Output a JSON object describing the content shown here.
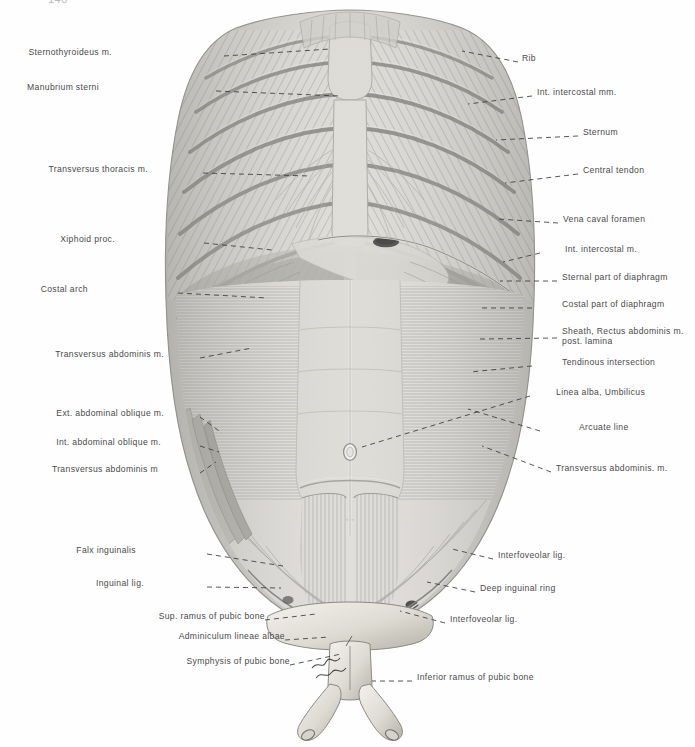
{
  "page": {
    "number": "140",
    "background": "#fefefe",
    "label_color": "#4a4a4a",
    "leader_color": "#3a3a3a"
  },
  "figure": {
    "type": "anatomical-engraving",
    "orientation": "posterior view of anterior body wall",
    "shading": "halftone engraving, grayscale"
  },
  "labels_left": [
    {
      "text": "Sternothyroideus m.",
      "x": 112,
      "y": 51,
      "lx": 224,
      "ly": 56,
      "tx": 330,
      "ty": 49
    },
    {
      "text": "Manubrium sterni",
      "x": 99,
      "y": 86,
      "lx": 216,
      "ly": 91,
      "tx": 340,
      "ty": 96
    },
    {
      "text": "Transversus thoracis m.",
      "x": 48,
      "y": 168,
      "lx": 203,
      "ly": 173,
      "tx": 310,
      "ty": 176
    },
    {
      "text": "Xiphoid proc.",
      "x": 115,
      "y": 238,
      "lx": 204,
      "ly": 243,
      "tx": 272,
      "ty": 250
    },
    {
      "text": "Costal arch",
      "x": 88,
      "y": 288,
      "lx": 178,
      "ly": 293,
      "tx": 268,
      "ty": 298
    },
    {
      "text": "Transversus abdominis m.",
      "x": 32,
      "y": 353,
      "lx": 200,
      "ly": 358,
      "tx": 252,
      "ty": 348
    },
    {
      "text": "Ext. abdominal oblique m.",
      "x": 32,
      "y": 412,
      "lx": 200,
      "ly": 417,
      "tx": 222,
      "ty": 433
    },
    {
      "text": "Int. abdominal oblique m.",
      "x": 35,
      "y": 441,
      "lx": 200,
      "ly": 446,
      "tx": 219,
      "ty": 452
    },
    {
      "text": "Transversus abdominis m",
      "x": 38,
      "y": 468,
      "lx": 200,
      "ly": 473,
      "tx": 216,
      "ty": 462
    },
    {
      "text": "Falx inguinalis",
      "x": 136,
      "y": 549,
      "lx": 207,
      "ly": 554,
      "tx": 283,
      "ty": 566
    },
    {
      "text": "Inguinal lig.",
      "x": 144,
      "y": 582,
      "lx": 207,
      "ly": 587,
      "tx": 281,
      "ty": 588
    },
    {
      "text": "Sup. ramus of pubic bone",
      "x": 135,
      "y": 615,
      "lx": 265,
      "ly": 620,
      "tx": 316,
      "ty": 614
    },
    {
      "text": "Adminiculum lineae albae",
      "x": 146,
      "y": 635,
      "lx": 285,
      "ly": 640,
      "tx": 330,
      "ty": 637
    },
    {
      "text": "Symphysis of pubic bone",
      "x": 163,
      "y": 660,
      "lx": 290,
      "ly": 665,
      "tx": 341,
      "ty": 654
    }
  ],
  "labels_right": [
    {
      "text": "Rib",
      "x": 522,
      "y": 57,
      "lx": 518,
      "ly": 62,
      "tx": 462,
      "ty": 51
    },
    {
      "text": "Int. intercostal mm.",
      "x": 537,
      "y": 91,
      "lx": 532,
      "ly": 96,
      "tx": 468,
      "ty": 104
    },
    {
      "text": "Sternum",
      "x": 583,
      "y": 131,
      "lx": 578,
      "ly": 136,
      "tx": 496,
      "ty": 140
    },
    {
      "text": "Central tendon",
      "x": 583,
      "y": 169,
      "lx": 578,
      "ly": 174,
      "tx": 505,
      "ty": 183
    },
    {
      "text": "Vena caval foramen",
      "x": 563,
      "y": 218,
      "lx": 558,
      "ly": 223,
      "tx": 498,
      "ty": 219
    },
    {
      "text": "Int. intercostal m.",
      "x": 565,
      "y": 248,
      "lx": 540,
      "ly": 253,
      "tx": 503,
      "ty": 262
    },
    {
      "text": "Sternal part of diaphragm",
      "x": 562,
      "y": 276,
      "lx": 557,
      "ly": 281,
      "tx": 500,
      "ty": 281
    },
    {
      "text": "Costal part of diaphragm",
      "x": 562,
      "y": 303,
      "lx": 532,
      "ly": 308,
      "tx": 478,
      "ty": 308
    },
    {
      "text": "Sheath, Rectus abdominis m.",
      "x": 562,
      "y": 330,
      "lx": 557,
      "ly": 338,
      "tx": 480,
      "ty": 339
    },
    {
      "text": "post. lamina",
      "x": 562,
      "y": 340,
      "lx": 0,
      "ly": 0,
      "tx": 0,
      "ty": 0
    },
    {
      "text": "Tendinous intersection",
      "x": 562,
      "y": 361,
      "lx": 532,
      "ly": 366,
      "tx": 470,
      "ty": 372
    },
    {
      "text": "Linea alba, Umbilicus",
      "x": 556,
      "y": 391,
      "lx": 530,
      "ly": 396,
      "tx": 352,
      "ty": 452
    },
    {
      "text": "Arcuate line",
      "x": 579,
      "y": 426,
      "lx": 540,
      "ly": 431,
      "tx": 468,
      "ty": 409
    },
    {
      "text": "Transversus abdominis. m.",
      "x": 556,
      "y": 467,
      "lx": 551,
      "ly": 472,
      "tx": 482,
      "ty": 446
    },
    {
      "text": "Interfoveolar lig.",
      "x": 498,
      "y": 554,
      "lx": 493,
      "ly": 559,
      "tx": 452,
      "ty": 549
    },
    {
      "text": "Deep inguinal ring",
      "x": 480,
      "y": 587,
      "lx": 475,
      "ly": 592,
      "tx": 427,
      "ty": 582
    },
    {
      "text": "Interfoveolar lig.",
      "x": 450,
      "y": 618,
      "lx": 445,
      "ly": 623,
      "tx": 400,
      "ty": 611
    },
    {
      "text": "Inferior ramus of pubic bone",
      "x": 417,
      "y": 676,
      "lx": 412,
      "ly": 681,
      "tx": 372,
      "ty": 681
    }
  ]
}
